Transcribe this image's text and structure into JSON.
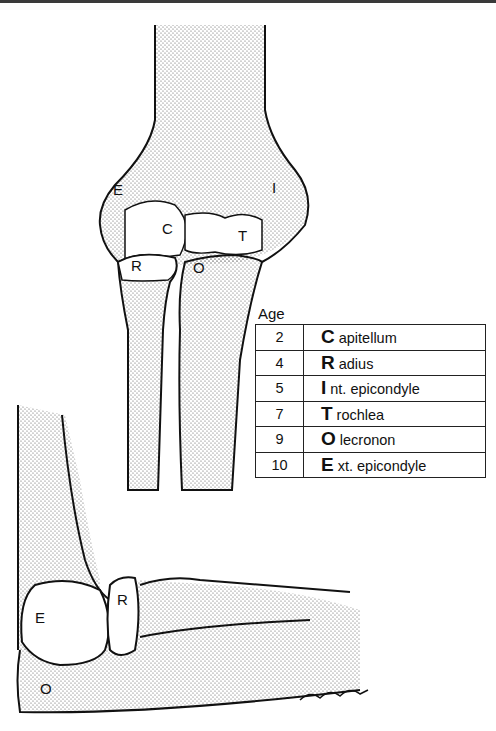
{
  "figure": {
    "anterior_view_labels": [
      "E",
      "C",
      "I",
      "T",
      "R",
      "O"
    ],
    "lateral_view_labels": [
      "E",
      "R",
      "O"
    ],
    "signature": "T.Rodgers"
  },
  "table": {
    "header": "Age",
    "rows": [
      {
        "age": "2",
        "letter": "C",
        "rest": "apitellum"
      },
      {
        "age": "4",
        "letter": "R",
        "rest": "adius"
      },
      {
        "age": "5",
        "letter": "I",
        "rest": "nt. epicondyle"
      },
      {
        "age": "7",
        "letter": "T",
        "rest": "rochlea"
      },
      {
        "age": "9",
        "letter": "O",
        "rest": "lecronon"
      },
      {
        "age": "10",
        "letter": "E",
        "rest": "xt. epicondyle"
      }
    ]
  }
}
